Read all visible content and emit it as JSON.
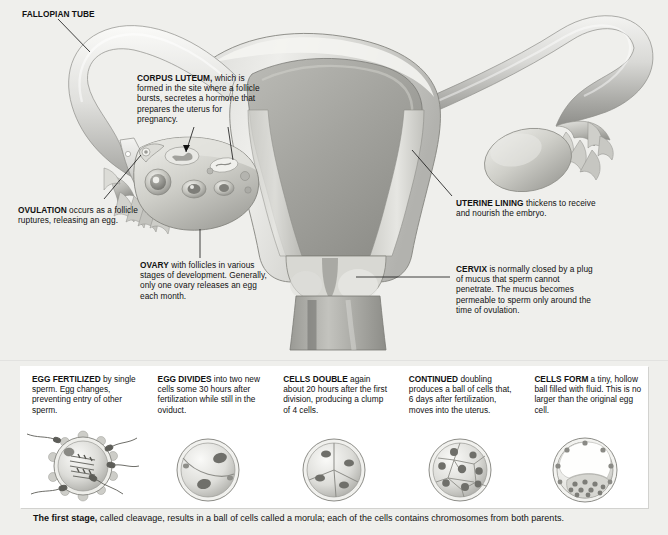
{
  "diagram": {
    "background_color": "#efefec",
    "panel_color": "#ffffff",
    "text_color": "#111111"
  },
  "anatomy_labels": [
    {
      "id": "fallopian-tube",
      "term": "FALLOPIAN TUBE",
      "rest": "",
      "full": "FALLOPIAN TUBE"
    },
    {
      "id": "corpus-luteum",
      "term": "CORPUS LUTEUM,",
      "rest": " which is formed in the site where a follicle bursts, secretes a hormone that prepares the uterus for pregnancy.",
      "full": "CORPUS LUTEUM, which is formed in the site where a follicle bursts, secretes a hormone that prepares the uterus for pregnancy."
    },
    {
      "id": "ovulation",
      "term": "OVULATION",
      "rest": " occurs as a follicle ruptures, releasing an egg.",
      "full": "OVULATION occurs as a follicle ruptures, releasing an egg."
    },
    {
      "id": "ovary",
      "term": "OVARY",
      "rest": " with follicles in various stages of development. Generally, only one ovary releases an egg each month.",
      "full": "OVARY with follicles in various stages of development. Generally, only one ovary releases an egg each month."
    },
    {
      "id": "uterine-lining",
      "term": "UTERINE LINING",
      "rest": " thickens to receive and nourish the embryo.",
      "full": "UTERINE LINING thickens to receive and nourish the embryo."
    },
    {
      "id": "cervix",
      "term": "CERVIX",
      "rest": " is normally closed by a plug of mucus that sperm cannot penetrate. The mucus becomes permeable to sperm only around the time of ovulation.",
      "full": "CERVIX is normally closed by a plug of mucus that sperm cannot penetrate. The mucus becomes permeable to sperm only around the time of ovulation."
    }
  ],
  "stages": [
    {
      "id": "stage-1-fertilized",
      "term": "EGG FERTILIZED",
      "rest": " by single sperm. Egg changes, preventing entry of other sperm.",
      "full": "EGG FERTILIZED by single sperm. Egg changes, preventing entry of other sperm.",
      "art": "fertilized-egg-with-sperm",
      "cell_count": 1
    },
    {
      "id": "stage-2-divides",
      "term": "EGG DIVIDES",
      "rest": " into two new cells some 30 hours after fertilization while still in the oviduct.",
      "full": "EGG DIVIDES into two new cells some 30 hours after fertilization while still in the oviduct.",
      "art": "two-cell-embryo",
      "cell_count": 2
    },
    {
      "id": "stage-3-double",
      "term": "CELLS DOUBLE",
      "rest": " again about 20 hours after the first division, producing a clump of 4 cells.",
      "full": "CELLS DOUBLE again about 20 hours after the first division, producing a clump of 4 cells.",
      "art": "four-cell-embryo",
      "cell_count": 4
    },
    {
      "id": "stage-4-continued",
      "term": "CONTINUED",
      "rest": " doubling produces a ball of cells that, 6 days after fertilization, moves into the uterus.",
      "full": "CONTINUED doubling produces a ball of cells that, 6 days after fertilization, moves into the uterus.",
      "art": "morula",
      "cell_count": 8
    },
    {
      "id": "stage-5-form",
      "term": "CELLS FORM",
      "rest": " a tiny, hollow ball filled with fluid. This is no larger than the original egg cell.",
      "full": "CELLS FORM a tiny, hollow ball filled with fluid. This is no larger than the original egg cell.",
      "art": "blastocyst",
      "cell_count": 0
    }
  ],
  "caption": {
    "lead": "The first stage,",
    "rest": " called cleavage, results in a ball of cells called a morula; each of the cells contains chromosomes from both parents.",
    "full": "The first stage, called cleavage, results in a ball of cells called a morula; each of the cells contains chromosomes from both parents."
  }
}
